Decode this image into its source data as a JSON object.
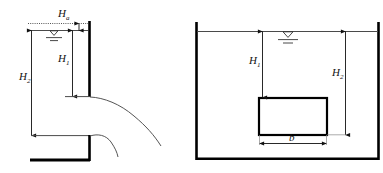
{
  "figure": {
    "background_color": "#ffffff",
    "line_color": "#111111",
    "thick_line_color": "#000000"
  },
  "left_diagram": {
    "name": "weir-outflow-diagram",
    "labels": {
      "head_above_surface": "H",
      "head_above_surface_sub": "a",
      "upper_depth": "H",
      "upper_depth_sub": "1",
      "total_depth": "H",
      "total_depth_sub": "2"
    },
    "elements": {
      "energy_line": "dotted-energy-grade-line",
      "water_surface": "free-water-surface-line",
      "water_level_symbol": "water-level-triangle",
      "vertical_wall": "upper-vertical-wall",
      "lower_wall": "lower-vertical-wall",
      "channel_floor": "channel-floor",
      "upper_nappe": "upper-jet-trajectory",
      "lower_nappe": "lower-jet-trajectory",
      "dimension_H_a": "dimension-line-Ha",
      "dimension_H_1": "dimension-line-H1",
      "dimension_H_2": "dimension-line-H2"
    }
  },
  "right_diagram": {
    "name": "submerged-body-tank-diagram",
    "labels": {
      "depth_to_top": "H",
      "depth_to_top_sub": "1",
      "depth_to_bottom": "H",
      "depth_to_bottom_sub": "2",
      "body_width": "b"
    },
    "elements": {
      "tank_left_wall": "tank-left-wall",
      "tank_right_wall": "tank-right-wall",
      "tank_floor": "tank-floor",
      "water_surface": "free-water-surface-line",
      "water_level_symbol": "water-level-triangle",
      "submerged_box": "submerged-rectangular-body",
      "dimension_H_1": "dimension-line-H1",
      "dimension_H_2": "dimension-line-H2",
      "dimension_b": "dimension-line-b"
    }
  }
}
